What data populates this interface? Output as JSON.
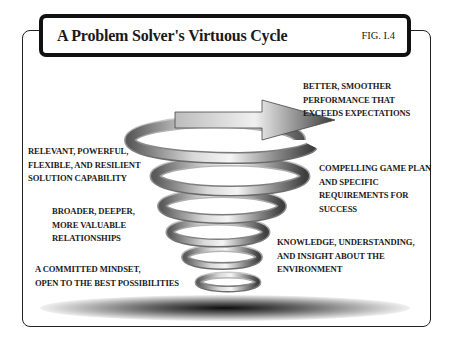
{
  "figure": {
    "title": "A Problem Solver's Virtuous Cycle",
    "fig_number": "FIG. I.4"
  },
  "labels": {
    "top_right": [
      "BETTER, SMOOTHER",
      "PERFORMANCE THAT",
      "EXCEEDS EXPECTATIONS"
    ],
    "mid_left_1": [
      "RELEVANT, POWERFUL,",
      "FLEXIBLE, AND RESILIENT",
      "SOLUTION CAPABILITY"
    ],
    "mid_right_1": [
      "COMPELLING GAME PLAN",
      "AND SPECIFIC",
      "REQUIREMENTS FOR",
      "SUCCESS"
    ],
    "mid_left_2": [
      "BROADER, DEEPER,",
      "MORE VALUABLE",
      "RELATIONSHIPS"
    ],
    "mid_right_2": [
      "KNOWLEDGE, UNDERSTANDING,",
      "AND INSIGHT ABOUT THE",
      "ENVIRONMENT"
    ],
    "bottom_left": [
      "A COMMITTED MINDSET,",
      "OPEN TO THE BEST POSSIBILITIES"
    ]
  },
  "graphic": {
    "type": "upward-spiral-arrow",
    "colors": {
      "band_light": "#e8e8e8",
      "band_mid": "#9a9a9a",
      "band_dark": "#4a4a4a",
      "frame": "#111111"
    }
  }
}
